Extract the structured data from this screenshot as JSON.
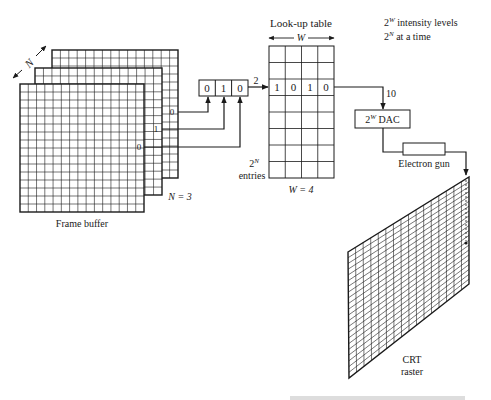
{
  "diagram": {
    "colors": {
      "ink": "#1a1a1a",
      "background": "#ffffff",
      "grid": "#333333"
    },
    "frame_buffer": {
      "label": "Frame buffer",
      "depth_label": "N",
      "planes_label": "N = 3",
      "plane_bits": [
        "0",
        "1",
        "0"
      ],
      "grid_cols": 15,
      "grid_rows": 16
    },
    "register": {
      "bits": [
        "0",
        "1",
        "0"
      ],
      "output_value": "2"
    },
    "lookup_table": {
      "title": "Look-up table",
      "width_label": "W",
      "width_value": "W = 4",
      "entries_power": "2",
      "entries_exp": "N",
      "entries_label": "entries",
      "rows": 8,
      "cols": 4,
      "selected_row_index": 2,
      "selected_row_values": [
        "1",
        "0",
        "1",
        "0"
      ],
      "output_value": "10"
    },
    "notes": {
      "line1_base": "2",
      "line1_exp": "W",
      "line1_text": " intensity levels",
      "line2_base": "2",
      "line2_exp": "N",
      "line2_text": " at a time"
    },
    "dac": {
      "base": "2",
      "exp": "W",
      "text": " DAC"
    },
    "electron_gun": {
      "label": "Electron gun"
    },
    "crt": {
      "label_line1": "CRT",
      "label_line2": "raster"
    }
  }
}
